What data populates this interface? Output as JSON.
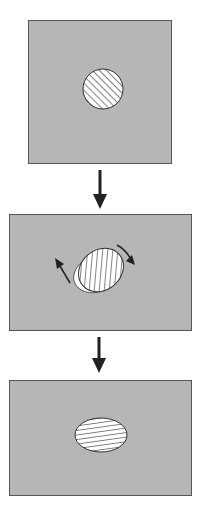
{
  "diagram": {
    "colors": {
      "background": "#ffffff",
      "panel": "#b6b6b6",
      "border": "#555555",
      "shape_fill": "#ffffff",
      "hatch": "#333333",
      "arrow": "#222222"
    },
    "stages": [
      {
        "id": 1,
        "shape": "circle",
        "hatch": "diagonal",
        "cx": 103,
        "cy": 89,
        "r": 20
      },
      {
        "id": 2,
        "shape": "rotating ellipse over circle",
        "hatch": "diagonal",
        "cx": 100,
        "cy": 271,
        "rotation_arrows": 2
      },
      {
        "id": 3,
        "shape": "ellipse",
        "hatch": "horizontal",
        "cx": 101,
        "cy": 435,
        "rx": 26,
        "ry": 17
      }
    ],
    "transition_arrows": 2
  }
}
